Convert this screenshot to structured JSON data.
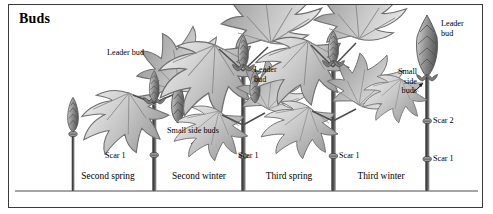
{
  "figure": {
    "title": "Buds",
    "border_color": "#3a3a3a",
    "background": "#ffffff",
    "ink_color": "#000000",
    "illustration_style": "grayscale engraving"
  },
  "labels": {
    "leader_bud_left": "Leader bud",
    "small_side_buds_center": "Small side buds",
    "leader_bud_center": "Leader\nbud",
    "leader_bud_center_line1": "Leader",
    "leader_bud_center_line2": "bud",
    "leader_bud_right_line1": "Leader",
    "leader_bud_right_line2": "bud",
    "small_side_buds_right_line1": "Small",
    "small_side_buds_right_line2": "side",
    "small_side_buds_right_line3": "buds",
    "scar1_a": "Scar 1",
    "scar1_b": "Scar 1",
    "scar1_c": "Scar 1",
    "scar1_d": "Scar 1",
    "scar2_right": "Scar 2"
  },
  "seasons": [
    {
      "id": "second-spring",
      "label": "Second spring"
    },
    {
      "id": "second-winter",
      "label": "Second winter"
    },
    {
      "id": "third-spring",
      "label": "Third spring"
    },
    {
      "id": "third-winter",
      "label": "Third winter"
    }
  ],
  "icons": {
    "leader_bud": "bud-icon",
    "side_bud": "side-bud-icon",
    "scar_node": "scar-node-icon",
    "leaf": "maple-leaf-icon",
    "stem": "stem-icon"
  }
}
